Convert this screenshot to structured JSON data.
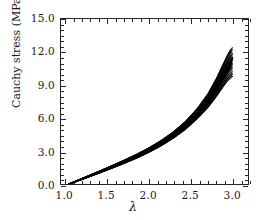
{
  "chart_data": {
    "type": "line",
    "title": "",
    "subtitle": "",
    "xlabel": "λ",
    "ylabel": "Cauchy stress (MPa)",
    "xlim": [
      0.95,
      3.2
    ],
    "ylim": [
      0.0,
      15.0
    ],
    "xticks": [
      1.0,
      1.5,
      2.0,
      2.5,
      3.0
    ],
    "xticklabels": [
      "1.0",
      "1.5",
      "2.0",
      "2.5",
      "3.0"
    ],
    "yticks": [
      0.0,
      3.0,
      6.0,
      9.0,
      12.0,
      15.0
    ],
    "yticklabels": [
      "0.0",
      "3.0",
      "6.0",
      "9.0",
      "12.0",
      "15.0"
    ],
    "minor_ticks": true,
    "tick_direction": "in",
    "ticks_all_sides": true,
    "grid": false,
    "legend": null,
    "line_color": "#000000",
    "background_color": "#ffffff",
    "frame_color": "#262626",
    "x": [
      1.05,
      1.15,
      1.25,
      1.4,
      1.55,
      1.7,
      1.85,
      2.0,
      2.15,
      2.3,
      2.45,
      2.6,
      2.72,
      2.82,
      2.9,
      2.95,
      2.99,
      3.01
    ],
    "series": [
      {
        "name": "band-upper",
        "values": [
          0.0,
          0.33,
          0.66,
          1.14,
          1.63,
          2.14,
          2.67,
          3.26,
          3.94,
          4.74,
          5.72,
          6.98,
          8.25,
          9.62,
          10.9,
          11.7,
          12.25,
          12.4
        ]
      },
      {
        "name": "band-center",
        "values": [
          0.0,
          0.3,
          0.6,
          1.05,
          1.51,
          1.99,
          2.49,
          3.05,
          3.69,
          4.44,
          5.34,
          6.48,
          7.6,
          8.78,
          9.85,
          10.5,
          10.95,
          11.1
        ]
      },
      {
        "name": "band-lower",
        "values": [
          0.0,
          0.27,
          0.54,
          0.96,
          1.39,
          1.84,
          2.31,
          2.84,
          3.44,
          4.14,
          4.96,
          5.98,
          6.95,
          7.94,
          8.8,
          9.3,
          9.6,
          9.7
        ]
      }
    ]
  }
}
